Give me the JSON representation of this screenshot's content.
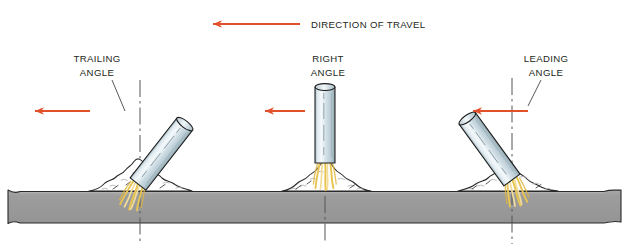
{
  "figure": {
    "kind": "welding-electrode-angle-diagram",
    "background_color": "#ffffff"
  },
  "travel": {
    "label": "DIRECTION OF TRAVEL",
    "arrow_color": "#e2502a",
    "arrow_name": "direction-of-travel-arrow",
    "arrow_x_start": 300,
    "arrow_x_end": 210,
    "arrow_y": 24,
    "label_x": 311,
    "label_y": 27
  },
  "stations": [
    {
      "id": "trailing",
      "label_line1": "TRAILING",
      "label_line2": "ANGLE",
      "label_x": 97,
      "label_y1": 62,
      "label_y2": 76,
      "electrode_tilt_deg": 38,
      "electrode_tip_x": 138,
      "electrode_tip_y": 184,
      "centerline_x": 140,
      "arrow_x_start": 90,
      "arrow_x_end": 32,
      "arrow_y": 111,
      "mound_center_x": 142,
      "mound_half_width": 53,
      "mound_height": 33,
      "leader_from_x": 112,
      "leader_from_y": 80,
      "leader_to_x": 124,
      "leader_to_y": 110
    },
    {
      "id": "right",
      "label_line1": "RIGHT",
      "label_line2": "ANGLE",
      "label_x": 328,
      "label_y1": 62,
      "label_y2": 76,
      "electrode_tilt_deg": 0,
      "electrode_tip_x": 325,
      "electrode_tip_y": 163,
      "centerline_x": 325,
      "arrow_x_start": 305,
      "arrow_x_end": 262,
      "arrow_y": 111,
      "mound_center_x": 328,
      "mound_half_width": 46,
      "mound_height": 35,
      "leader_from_x": 0,
      "leader_from_y": 0,
      "leader_to_x": 0,
      "leader_to_y": 0
    },
    {
      "id": "leading",
      "label_line1": "LEADING",
      "label_line2": "ANGLE",
      "label_x": 546,
      "label_y1": 62,
      "label_y2": 76,
      "electrode_tilt_deg": -36,
      "electrode_tip_x": 512,
      "electrode_tip_y": 180,
      "centerline_x": 512,
      "arrow_x_start": 528,
      "arrow_x_end": 470,
      "arrow_y": 111,
      "mound_center_x": 508,
      "mound_half_width": 50,
      "mound_height": 32,
      "leader_from_x": 539,
      "leader_from_y": 80,
      "leader_to_x": 528,
      "leader_to_y": 105
    }
  ],
  "electrode": {
    "name": "welding-electrode",
    "length": 78,
    "width": 20,
    "outline_color": "#1a1a1a",
    "body_light": "#eef5f8",
    "body_mid": "#c3d4dc",
    "body_edge": "#9fb4bd"
  },
  "arc": {
    "name": "welding-arc-stream",
    "color": "#e8c451",
    "color_light": "#f2dd9a"
  },
  "spatter": {
    "name": "weld-spatter-mound",
    "outline_color": "#2b2b2b",
    "fill_color": "#ffffff",
    "stipple_color": "#b9b9b9"
  },
  "base_plate": {
    "name": "base-metal-plate",
    "top_y": 190,
    "bottom_y": 222,
    "fill_color": "#9d9d9d",
    "outline_color": "#2b2b2b",
    "left_x": 8,
    "right_x": 621
  },
  "centerline": {
    "name": "vertical-centerline",
    "color": "#555555",
    "top_y": 78,
    "bottom_y": 244
  },
  "colors": {
    "accent_red": "#e2502a",
    "text": "#231f20",
    "plate_gray": "#9d9d9d"
  }
}
